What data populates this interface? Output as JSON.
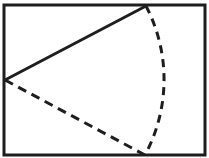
{
  "diagram": {
    "type": "geometry-sector",
    "colors": {
      "background": "#ffffff",
      "stroke": "#1e1e1e"
    },
    "frame": {
      "x": 4,
      "y": 5,
      "width": 201,
      "height": 150,
      "stroke_width": 3
    },
    "center": {
      "x": 5,
      "y": 80
    },
    "top_point": {
      "x": 146,
      "y": 6
    },
    "bottom_point": {
      "x": 145,
      "y": 155
    },
    "arc": {
      "radius": 159,
      "style": "dashed"
    },
    "solid_radius": {
      "style": "solid",
      "stroke_width": 3
    },
    "dashed_radius": {
      "style": "dashed",
      "stroke_width": 3
    }
  }
}
